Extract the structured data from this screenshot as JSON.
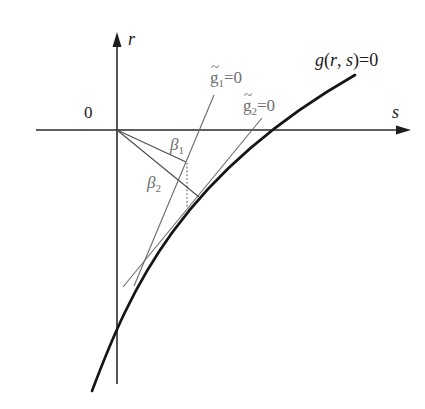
{
  "figure": {
    "width": 425,
    "height": 409,
    "background": "#ffffff"
  },
  "labels": {
    "origin": "0",
    "r_axis": "r",
    "s_axis": "s",
    "curve": {
      "func": "g",
      "open": "(",
      "r": "r",
      "comma": ", ",
      "s": "s",
      "close": ")",
      "eq": "=0"
    },
    "g1": {
      "tilde": "~",
      "base": "g",
      "sub": "1",
      "eq": "=0"
    },
    "g2": {
      "tilde": "~",
      "base": "g",
      "sub": "2",
      "eq": "=0"
    },
    "beta1": {
      "base": "β",
      "sub": "1"
    },
    "beta2": {
      "base": "β",
      "sub": "2"
    }
  },
  "geometry": {
    "s_axis": "M36,130 L400,130",
    "s_arrow": "M411,130 L396,125.5 L396,134.5 Z",
    "r_axis": "M117,384 L117,44",
    "r_arrow": "M117,32 L112.5,47 L121.5,47 Z",
    "curve_g": "M92,391 C130,290 180,175 355,75",
    "tangent_g1": "M214,95 L134,286",
    "tangent_g2": "M262,118 L123,287",
    "ray_beta1": "M117,130 L186,162",
    "ray_beta2": "M117,130 L199,197",
    "dotted_drop": "M187,163 L187,208"
  },
  "colors": {
    "axes": "#2a2a2a",
    "curve": "#151515",
    "tangent_lines": "#6a6a6a",
    "labels": "#1a1a1a",
    "gray_labels": "#6e6e6e"
  }
}
